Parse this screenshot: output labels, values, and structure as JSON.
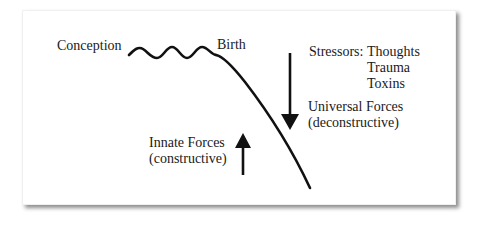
{
  "diagram": {
    "labels": {
      "conception": "Conception",
      "birth": "Birth",
      "stressors_title": "Stressors:",
      "stressors": [
        "Thoughts",
        "Trauma",
        "Toxins"
      ],
      "universal_forces": "Universal Forces",
      "universal_forces_note": "(deconstructive)",
      "innate_forces": "Innate Forces",
      "innate_forces_note": "(constructive)"
    },
    "colors": {
      "stroke": "#111111",
      "background": "#ffffff"
    }
  }
}
